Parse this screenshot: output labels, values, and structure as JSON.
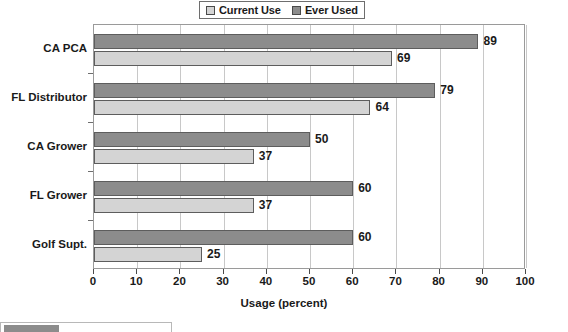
{
  "legend": {
    "position": "top-center",
    "entries": [
      {
        "label": "Current Use",
        "swatch_color": "#d4d4d4",
        "icon": "legend-swatch-light"
      },
      {
        "label": "Ever Used",
        "swatch_color": "#8c8c8c",
        "icon": "legend-swatch-dark"
      }
    ]
  },
  "axis": {
    "xlabel": "Usage (percent)",
    "ticks": [
      "0",
      "10",
      "20",
      "30",
      "40",
      "50",
      "60",
      "70",
      "80",
      "90",
      "100"
    ]
  },
  "chart_data": {
    "type": "bar",
    "orientation": "horizontal",
    "title": "",
    "subtitle": "",
    "xlabel": "Usage (percent)",
    "ylabel": "",
    "xlim": [
      0,
      100
    ],
    "xticks": [
      0,
      10,
      20,
      30,
      40,
      50,
      60,
      70,
      80,
      90,
      100
    ],
    "grid": true,
    "legend_position": "top-center",
    "categories": [
      "CA PCA",
      "FL Distributor",
      "CA Grower",
      "FL Grower",
      "Golf Supt."
    ],
    "series": [
      {
        "name": "Current Use",
        "color": "#d4d4d4",
        "values": [
          69,
          64,
          37,
          37,
          25
        ]
      },
      {
        "name": "Ever Used",
        "color": "#8c8c8c",
        "values": [
          89,
          79,
          50,
          60,
          60
        ]
      }
    ]
  }
}
